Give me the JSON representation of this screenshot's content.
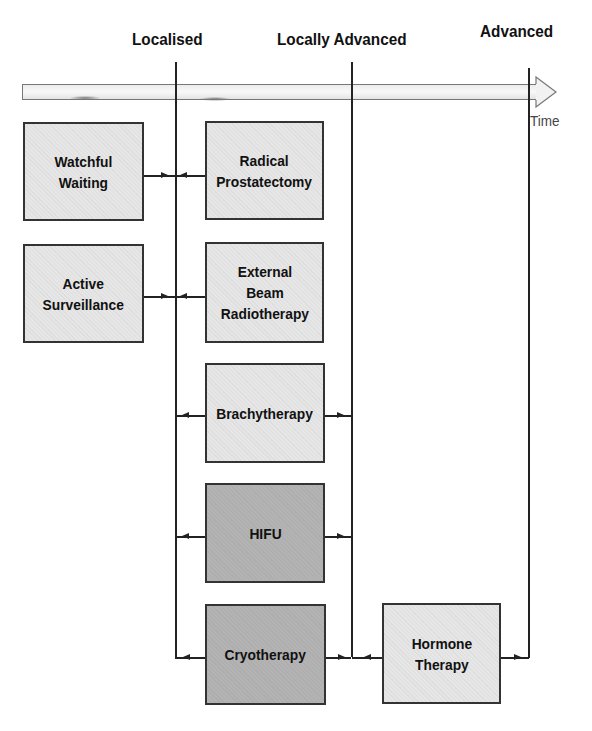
{
  "diagram": {
    "stages": [
      {
        "label": "Localised"
      },
      {
        "label": "Locally Advanced"
      },
      {
        "label": "Advanced"
      }
    ],
    "timeline": {
      "label": "Time",
      "direction": "left-to-right"
    },
    "treatments": [
      {
        "label": "Watchful\nWaiting",
        "shade": "light",
        "connects_to": "Localised"
      },
      {
        "label": "Active\nSurveillance",
        "shade": "light",
        "connects_to": "Localised"
      },
      {
        "label": "Radical\nProstatectomy",
        "shade": "light",
        "connects_to": "Localised"
      },
      {
        "label": "External\nBeam\nRadiotherapy",
        "shade": "light",
        "connects_to": "Localised"
      },
      {
        "label": "Brachytherapy",
        "shade": "light",
        "connects_to": "Localised, Locally Advanced"
      },
      {
        "label": "HIFU",
        "shade": "dark",
        "connects_to": "Localised, Locally Advanced"
      },
      {
        "label": "Cryotherapy",
        "shade": "dark",
        "connects_to": "Localised, Locally Advanced"
      },
      {
        "label": "Hormone\nTherapy",
        "shade": "light",
        "connects_to": "Locally Advanced, Advanced"
      }
    ],
    "colors": {
      "light_box": "#e6e6e6",
      "dark_box": "#b3b3b3",
      "line": "#222222"
    }
  }
}
